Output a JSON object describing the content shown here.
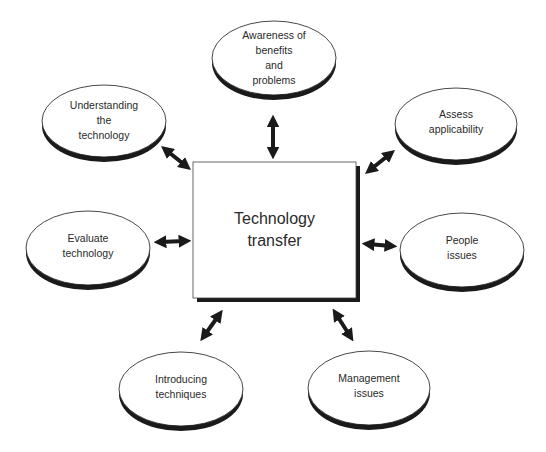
{
  "diagram": {
    "title": "Technology transfer",
    "center": {
      "lines": [
        "Technology",
        "transfer"
      ]
    },
    "nodes": [
      {
        "id": "awareness",
        "lines": [
          "Awareness of",
          "benefits",
          "and",
          "problems"
        ]
      },
      {
        "id": "understanding",
        "lines": [
          "Understanding",
          "the",
          "technology"
        ]
      },
      {
        "id": "assess",
        "lines": [
          "Assess",
          "applicability"
        ]
      },
      {
        "id": "evaluate",
        "lines": [
          "Evaluate",
          "technology"
        ]
      },
      {
        "id": "people",
        "lines": [
          "People",
          "issues"
        ]
      },
      {
        "id": "introducing",
        "lines": [
          "Introducing",
          "techniques"
        ]
      },
      {
        "id": "management",
        "lines": [
          "Management",
          "issues"
        ]
      }
    ],
    "connector_style": "double-headed arrow",
    "colors": {
      "stroke": "#1a1a1a",
      "shadow": "#1a1a1a",
      "fill": "#ffffff",
      "text": "#2a2a2a"
    }
  }
}
